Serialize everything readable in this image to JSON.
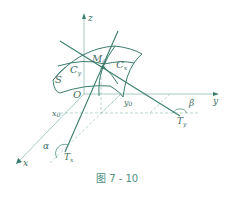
{
  "figure": {
    "caption": "图 7 - 10",
    "colors": {
      "curve": "#3a7d6e",
      "axis": "#8fbcb2",
      "dashed": "#9cc4ba",
      "text": "#3d6b62",
      "caption": "#4e8f82"
    },
    "axes": {
      "z": "z",
      "y": "y",
      "x": "x",
      "origin": "O"
    },
    "labels": {
      "surface": "S",
      "point": "M",
      "point_sub": "0",
      "curve_y": "C",
      "curve_y_sub": "y",
      "curve_x": "C",
      "curve_x_sub": "x",
      "x0": "x",
      "x0_sub": "0",
      "y0": "y",
      "y0_sub": "0",
      "tangent_x": "T",
      "tangent_x_sub": "x",
      "tangent_y": "T",
      "tangent_y_sub": "y",
      "alpha": "α",
      "beta": "β"
    }
  }
}
